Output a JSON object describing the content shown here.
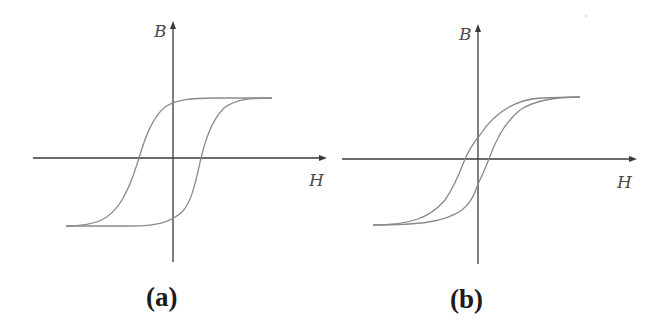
{
  "figure": {
    "panels": [
      {
        "id": "a",
        "label": "(a)",
        "y_axis_label": "B",
        "x_axis_label": "H",
        "description": "wide hysteresis loop"
      },
      {
        "id": "b",
        "label": "(b)",
        "y_axis_label": "B",
        "x_axis_label": "H",
        "description": "narrow hysteresis loop"
      }
    ],
    "colors": {
      "axis": "#3a3a3a",
      "curve": "#8a8a8a",
      "text": "#1a1a1a"
    }
  }
}
